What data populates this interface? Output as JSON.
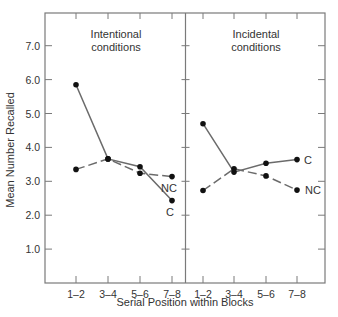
{
  "chart_data": {
    "type": "line",
    "ylabel": "Mean Number Recalled",
    "xlabel": "Serial Position within Blocks",
    "ylim": [
      0,
      8.0
    ],
    "yticks": [
      1.0,
      2.0,
      3.0,
      4.0,
      5.0,
      6.0,
      7.0
    ],
    "ytick_labels": [
      "1.0",
      "2.0",
      "3.0",
      "4.0",
      "5.0",
      "6.0",
      "7.0"
    ],
    "grid": false,
    "panels": [
      {
        "title_line1": "Intentional",
        "title_line2": "conditions",
        "categories": [
          "1–2",
          "3–4",
          "5–6",
          "7–8"
        ],
        "series": [
          {
            "name": "C",
            "style": "solid",
            "values": [
              5.85,
              3.66,
              3.43,
              2.43
            ]
          },
          {
            "name": "NC",
            "style": "dashed",
            "values": [
              3.35,
              3.66,
              3.24,
              3.14
            ]
          }
        ]
      },
      {
        "title_line1": "Incidental",
        "title_line2": "conditions",
        "categories": [
          "1–2",
          "3–4",
          "5–6",
          "7–8"
        ],
        "series": [
          {
            "name": "C",
            "style": "solid",
            "values": [
              4.7,
              3.27,
              3.53,
              3.64
            ]
          },
          {
            "name": "NC",
            "style": "dashed",
            "values": [
              2.73,
              3.37,
              3.16,
              2.74
            ]
          }
        ]
      }
    ]
  },
  "colors": {
    "line": "#6b6b6b",
    "dot": "#111111",
    "axis": "#7a7a7a",
    "text": "#333333",
    "background": "#ffffff"
  }
}
